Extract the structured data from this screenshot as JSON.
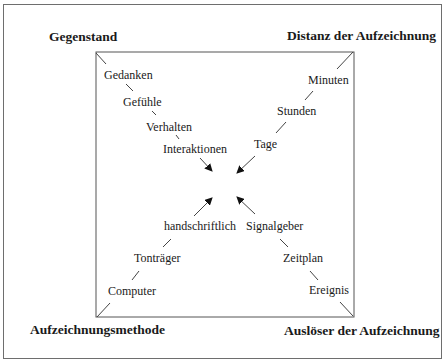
{
  "corners": {
    "top_left": "Gegenstand",
    "top_right": "Distanz der Aufzeichnung",
    "bottom_left": "Aufzeichnungsmethode",
    "bottom_right": "Auslöser der Aufzeichnung"
  },
  "axes": {
    "gegenstand": [
      "Gedanken",
      "Gefühle",
      "Verhalten",
      "Interaktionen"
    ],
    "distanz": [
      "Minuten",
      "Stunden",
      "Tage"
    ],
    "methode": [
      "handschriftlich",
      "Tonträger",
      "Computer"
    ],
    "ausloeser": [
      "Ereignis",
      "Zeitplan",
      "Signalgeber"
    ]
  }
}
